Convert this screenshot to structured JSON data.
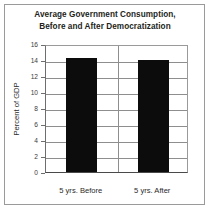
{
  "chart_data": {
    "type": "bar",
    "title": "Average Government Consumption, Before and After Democratization",
    "title_line1": "Average Government Consumption,",
    "title_line2": "Before and After Democratization",
    "categories": [
      "5 yrs. Before",
      "5 yrs. After"
    ],
    "values": [
      14.2,
      14.0
    ],
    "xlabel": "",
    "ylabel": "Percent of GDP",
    "ylim": [
      0,
      16
    ],
    "ytick_step": 2,
    "yticks": [
      16,
      14,
      12,
      10,
      8,
      6,
      4,
      2,
      0
    ],
    "ytick_labels": [
      "16",
      "14",
      "12",
      "10",
      "8",
      "6",
      "4",
      "2",
      "0"
    ],
    "grid": true,
    "grid_axis": "y",
    "legend": false,
    "legend_position": "none",
    "bar_color": "#0c0c0c",
    "grid_color": "#8e8e8e",
    "frame_color": "#9a9a9a",
    "text_color": "#231f20"
  }
}
